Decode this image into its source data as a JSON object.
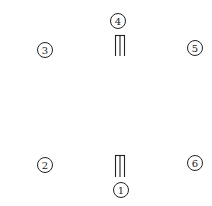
{
  "diagram": {
    "colors": {
      "stroke": "#222222",
      "background": "#ffffff"
    },
    "positions": [
      {
        "label": "1",
        "cx": 121,
        "cy": 190
      },
      {
        "label": "2",
        "cx": 45,
        "cy": 165
      },
      {
        "label": "3",
        "cx": 45,
        "cy": 50
      },
      {
        "label": "4",
        "cx": 118,
        "cy": 21
      },
      {
        "label": "5",
        "cx": 195,
        "cy": 48
      },
      {
        "label": "6",
        "cx": 195,
        "cy": 163
      }
    ],
    "wickets": [
      {
        "name": "top-wicket",
        "x": 115,
        "y": 35,
        "width": 10,
        "height": 21
      },
      {
        "name": "bottom-wicket",
        "x": 115,
        "y": 155,
        "width": 10,
        "height": 22
      }
    ]
  }
}
